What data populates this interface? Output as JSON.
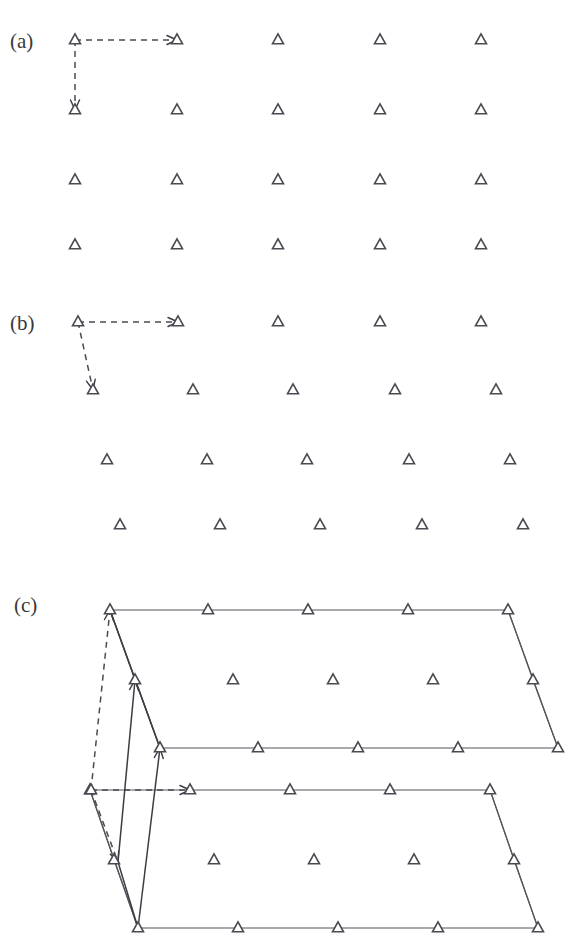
{
  "figure": {
    "background_color": "#ffffff",
    "marker_color": "#4a4a52",
    "line_color": "#55555c",
    "vector_color": "#3c3c44",
    "width": 569,
    "height": 938
  },
  "panels": [
    {
      "id": "a",
      "label": "(a)",
      "label_pos": {
        "x": 10,
        "y": 48
      },
      "description": "Rectangular (square) plane lattice with orthogonal primitive translation vectors",
      "marker_name": "lattice-point-triangle",
      "lattice": {
        "type": "rectangular",
        "rows": 4,
        "cols": 5,
        "col_x": [
          75,
          177,
          278,
          380,
          481
        ],
        "row_y": [
          40,
          110,
          180,
          245
        ],
        "row_shift": [
          0,
          0,
          0,
          0
        ]
      },
      "vectors": [
        {
          "name": "primitive-vector-a1",
          "style": "dashed",
          "from": {
            "x": 75,
            "y": 40
          },
          "to": {
            "x": 177,
            "y": 40
          }
        },
        {
          "name": "primitive-vector-a2",
          "style": "dashed",
          "from": {
            "x": 75,
            "y": 40
          },
          "to": {
            "x": 75,
            "y": 110
          }
        }
      ]
    },
    {
      "id": "b",
      "label": "(b)",
      "label_pos": {
        "x": 10,
        "y": 330
      },
      "description": "Oblique plane lattice obtained by shearing successive rows sideways",
      "marker_name": "lattice-point-triangle",
      "lattice": {
        "type": "oblique",
        "rows": 4,
        "cols": 5,
        "col_x": [
          78,
          178,
          278,
          380,
          481
        ],
        "row_y": [
          322,
          390,
          460,
          525
        ],
        "row_shift": [
          0,
          15,
          29,
          42
        ]
      },
      "vectors": [
        {
          "name": "primitive-vector-a1",
          "style": "dashed",
          "from": {
            "x": 78,
            "y": 322
          },
          "to": {
            "x": 178,
            "y": 322
          }
        },
        {
          "name": "primitive-vector-a2",
          "style": "dashed",
          "from": {
            "x": 78,
            "y": 322
          },
          "to": {
            "x": 93,
            "y": 390
          }
        }
      ]
    },
    {
      "id": "c",
      "label": "(c)",
      "label_pos": {
        "x": 14,
        "y": 612
      },
      "description": "Three-dimensional lattice: two stacked oblique planes joined by a third primitive vector",
      "marker_name": "lattice-point-triangle",
      "planes": [
        {
          "name": "upper-plane",
          "rows": 3,
          "cols": 5,
          "col_x": [
            110,
            208,
            308,
            408,
            508
          ],
          "row_y": [
            610,
            680,
            748
          ],
          "row_shift": [
            0,
            25,
            50
          ],
          "edges": [
            "top",
            "right",
            "bottom",
            "left"
          ]
        },
        {
          "name": "lower-plane",
          "rows": 3,
          "cols": 5,
          "col_x": [
            138,
            238,
            338,
            438,
            538
          ],
          "row_y": [
            790,
            860,
            928
          ],
          "row_shift": [
            -48,
            -24,
            0
          ],
          "edges": [
            "top",
            "right",
            "bottom",
            "left"
          ]
        }
      ],
      "extra_points": [
        {
          "name": "origin-lattice-point",
          "x": 91,
          "y": 790
        }
      ],
      "vectors": [
        {
          "name": "primitive-vector-a1",
          "style": "dashed",
          "from": {
            "x": 91,
            "y": 790
          },
          "to": {
            "x": 190,
            "y": 790
          }
        },
        {
          "name": "primitive-vector-a2",
          "style": "dashed",
          "from": {
            "x": 91,
            "y": 790
          },
          "to": {
            "x": 118,
            "y": 862
          }
        },
        {
          "name": "primitive-vector-a3",
          "style": "dashed",
          "from": {
            "x": 91,
            "y": 790
          },
          "to": {
            "x": 110,
            "y": 610
          }
        },
        {
          "name": "translation-vector-solid-upper",
          "style": "solid",
          "from": {
            "x": 118,
            "y": 862
          },
          "to": {
            "x": 135,
            "y": 680
          }
        },
        {
          "name": "translation-vector-solid-lower",
          "style": "solid",
          "from": {
            "x": 138,
            "y": 928
          },
          "to": {
            "x": 160,
            "y": 748
          }
        },
        {
          "name": "edge-solid-top-left-diagonal",
          "style": "plain",
          "from": {
            "x": 110,
            "y": 610
          },
          "to": {
            "x": 160,
            "y": 748
          }
        },
        {
          "name": "edge-solid-bottom-left-diagonal",
          "style": "plain",
          "from": {
            "x": 118,
            "y": 862
          },
          "to": {
            "x": 138,
            "y": 928
          }
        }
      ]
    }
  ]
}
